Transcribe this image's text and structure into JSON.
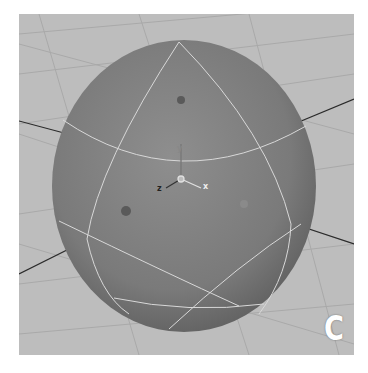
{
  "viewport": {
    "panel_label": "C",
    "axis_labels": {
      "x": "x",
      "y": "y",
      "z": "z"
    },
    "colors": {
      "background": "#bdbdbd",
      "grid": "#a8a8a8",
      "sphere": "#7c7c7c",
      "wireframe": "#d8d8d8",
      "ground_axis": "#2a2a2a"
    }
  }
}
